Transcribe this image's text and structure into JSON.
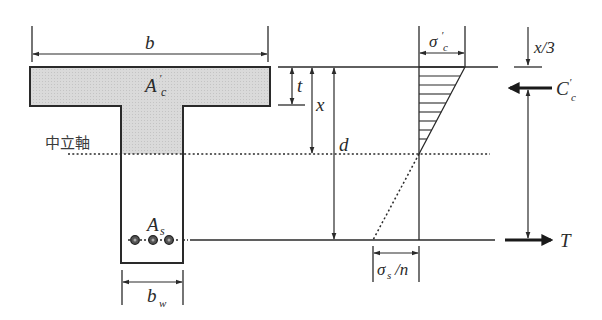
{
  "figure": {
    "type": "T-beam cross-section with stress distribution",
    "colors": {
      "line": "#2a2a2a",
      "fill": "#d9d9d9",
      "background": "#ffffff"
    }
  },
  "labels": {
    "flange_width": "b",
    "compression_area_main": "A",
    "compression_area_prime": "′",
    "compression_area_sub": "c",
    "neutral_axis": "中立軸",
    "flange_thickness": "t",
    "neutral_axis_depth": "x",
    "effective_depth": "d",
    "steel_area_main": "A",
    "steel_area_sub": "s",
    "web_width_main": "b",
    "web_width_sub": "w",
    "concrete_stress_main": "σ",
    "concrete_stress_prime": "′",
    "concrete_stress_sub": "c",
    "steel_stress_main": "σ",
    "steel_stress_sub": "s",
    "steel_stress_rest": "/n",
    "resultant_location": "x/3",
    "compression_force_main": "C",
    "compression_force_prime": "′",
    "compression_force_sub": "c",
    "tension_force": "T"
  },
  "rebars": {
    "count": 3
  }
}
